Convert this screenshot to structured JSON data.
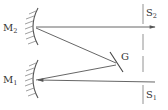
{
  "diagram": {
    "type": "optical-setup",
    "colors": {
      "line": "#555555",
      "text": "#333333",
      "background": "#ffffff"
    },
    "labels": {
      "mirror_top": {
        "base": "M",
        "sub": "2"
      },
      "mirror_bottom": {
        "base": "M",
        "sub": "1"
      },
      "grating": {
        "base": "G"
      },
      "slit_top": {
        "base": "S",
        "sub": "2"
      },
      "slit_bottom": {
        "base": "S",
        "sub": "1"
      }
    },
    "components": [
      {
        "id": "M2",
        "kind": "concave-mirror",
        "position": "upper-left"
      },
      {
        "id": "M1",
        "kind": "concave-mirror",
        "position": "lower-left"
      },
      {
        "id": "G",
        "kind": "grating",
        "position": "center-right"
      },
      {
        "id": "S2",
        "kind": "slit",
        "position": "upper-right"
      },
      {
        "id": "S1",
        "kind": "slit",
        "position": "lower-right"
      }
    ],
    "rays": [
      {
        "from": "S1",
        "to": "M1"
      },
      {
        "from": "M1",
        "to": "G"
      },
      {
        "from": "G",
        "to": "M2"
      },
      {
        "from": "M2",
        "to": "S2"
      }
    ]
  }
}
